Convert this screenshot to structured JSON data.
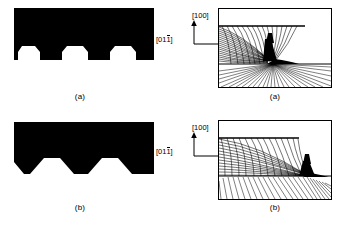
{
  "figure": {
    "background_color": "#ffffff",
    "ink_color": "#000000",
    "width_px": 338,
    "height_px": 227
  },
  "panels": [
    {
      "id": "a",
      "caption": "(a)",
      "cross_section": {
        "name": "groove-profile-a",
        "description": "Solid black slab with three re-entrant (undercut) trapezoidal grooves opening downward; groove mouths narrower than groove floors.",
        "groove_count": 3,
        "groove_shape": "undercut-trapezoid",
        "slab_fill": "#000000"
      },
      "field_plot": {
        "name": "slip-line-field-a",
        "description": "Orthogonal curvilinear characteristics net fanning from the upper-left free surface, converging into a narrow dark wedge near the centre, with a radial fan spreading through the lower band.",
        "features": [
          "horizontal free-surface line at upper region",
          "dense orthogonal mesh upper-left",
          "dark convergence wedge at centre",
          "radial fan in lower band",
          "horizontal base line"
        ],
        "mesh_lines_family_1": 26,
        "mesh_lines_family_2": 22,
        "fan_rays": 34,
        "convergence_x_fraction": 0.46,
        "convergence_y_fraction": 0.7
      },
      "directions": {
        "vertical": "[100]",
        "horizontal_prefix": "[01",
        "horizontal_barred": "1",
        "horizontal_suffix": "]"
      }
    },
    {
      "id": "b",
      "caption": "(b)",
      "cross_section": {
        "name": "groove-profile-b",
        "description": "Solid black slab with three V-shaped / scalloped notches cut into the lower edge and chamfered lower corners.",
        "groove_count": 3,
        "groove_shape": "v-notch-scalloped",
        "slab_fill": "#000000"
      },
      "field_plot": {
        "name": "slip-line-field-b",
        "description": "Broad orthogonal characteristics net sweeping from the upper-left downward to the right, converging into a dark wedge at the lower-right, above a band of near-vertical lines.",
        "features": [
          "horizontal free-surface line at upper region",
          "broad curved orthogonal mesh",
          "dark convergence wedge lower-right",
          "near-vertical line band across lower region",
          "horizontal base line"
        ],
        "mesh_lines_family_1": 24,
        "mesh_lines_family_2": 20,
        "fan_rays": 30,
        "convergence_x_fraction": 0.8,
        "convergence_y_fraction": 0.74
      },
      "directions": {
        "vertical": "[100]",
        "horizontal_prefix": "[01",
        "horizontal_barred": "1",
        "horizontal_suffix": "]"
      }
    }
  ]
}
